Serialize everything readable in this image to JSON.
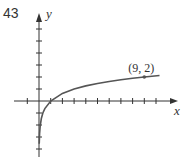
{
  "problem_number": "43",
  "chart_data": {
    "type": "line",
    "title": "",
    "function": "y = log_3(x)",
    "xlabel": "x",
    "ylabel": "y",
    "xlim": [
      -1.5,
      10.5
    ],
    "ylim": [
      -4.5,
      7
    ],
    "x_ticks": [
      -1,
      1,
      2,
      3,
      4,
      5,
      6,
      7,
      8,
      9,
      10
    ],
    "y_ticks": [
      -4,
      -3,
      -2,
      -1,
      1,
      2,
      3,
      4,
      5,
      6
    ],
    "grid": false,
    "annotations": [
      {
        "label": "(9, 2)",
        "x": 9,
        "y": 2
      }
    ],
    "series": [
      {
        "name": "curve",
        "x": [
          0.02,
          0.05,
          0.1,
          0.2,
          0.33,
          0.5,
          1,
          2,
          3,
          4,
          5,
          6,
          7,
          8,
          9,
          10.3
        ],
        "values": [
          -3.56,
          -2.73,
          -2.1,
          -1.46,
          -1.0,
          -0.63,
          0,
          0.63,
          1,
          1.26,
          1.46,
          1.63,
          1.77,
          1.89,
          2,
          2.12
        ]
      }
    ],
    "color": "#555555"
  }
}
